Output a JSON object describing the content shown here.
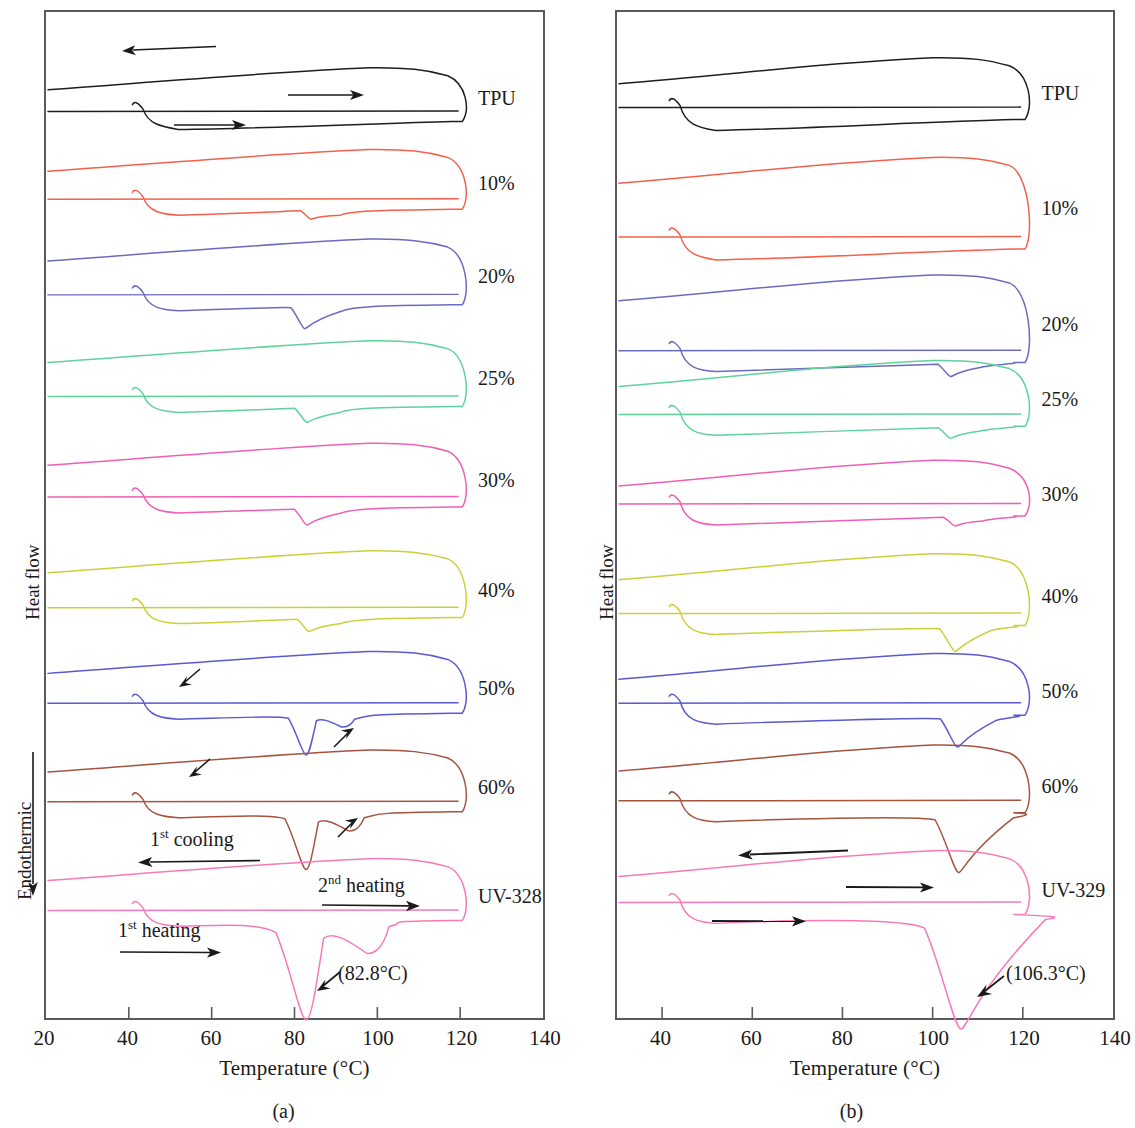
{
  "figure": {
    "type": "dsc-thermogram-pair",
    "panels": [
      {
        "id": "a",
        "caption": "(a)",
        "xlabel": "Temperature (°C)",
        "ylabel": "Heat flow",
        "direction_label": "Endothermic",
        "direction_arrow": "down",
        "xlim": [
          20,
          140
        ],
        "xticks": [
          20,
          40,
          60,
          80,
          100,
          120,
          140
        ],
        "xticklabels": [
          "20",
          "40",
          "60",
          "80",
          "100",
          "120",
          "140"
        ],
        "curves": [
          {
            "label": "TPU",
            "color": "#1e1e1e"
          },
          {
            "label": "10%",
            "color": "#f4614b"
          },
          {
            "label": "20%",
            "color": "#6a6ac0"
          },
          {
            "label": "25%",
            "color": "#5fd39a"
          },
          {
            "label": "30%",
            "color": "#ef5fb5"
          },
          {
            "label": "40%",
            "color": "#cdcf3a"
          },
          {
            "label": "50%",
            "color": "#5a5ad0"
          },
          {
            "label": "60%",
            "color": "#a6533f"
          },
          {
            "label": "UV-328",
            "color": "#f77ab8"
          }
        ],
        "annotations": [
          {
            "text": "1st cooling",
            "sup": "st",
            "base": "1",
            "tail": " cooling",
            "arrow": "left"
          },
          {
            "text": "2nd heating",
            "sup": "nd",
            "base": "2",
            "tail": " heating",
            "arrow": "right"
          },
          {
            "text": "1st heating",
            "sup": "st",
            "base": "1",
            "tail": " heating",
            "arrow": "right"
          },
          {
            "text": "(82.8°C)",
            "arrow": "down-left"
          }
        ],
        "peak_label": "(82.8°C)",
        "peak_temperature": 82.8
      },
      {
        "id": "b",
        "caption": "(b)",
        "xlabel": "Temperature (°C)",
        "ylabel": "Heat flow",
        "xlim": [
          30,
          140
        ],
        "xticks": [
          40,
          60,
          80,
          100,
          120,
          140
        ],
        "xticklabels": [
          "40",
          "60",
          "80",
          "100",
          "120",
          "140"
        ],
        "curves": [
          {
            "label": "TPU",
            "color": "#1e1e1e"
          },
          {
            "label": "10%",
            "color": "#f4614b"
          },
          {
            "label": "20%",
            "color": "#6a6ac0"
          },
          {
            "label": "25%",
            "color": "#5fd39a"
          },
          {
            "label": "30%",
            "color": "#ef5fb5"
          },
          {
            "label": "40%",
            "color": "#cdcf3a"
          },
          {
            "label": "50%",
            "color": "#5a5ad0"
          },
          {
            "label": "60%",
            "color": "#a6533f"
          },
          {
            "label": "UV-329",
            "color": "#f77ab8"
          }
        ],
        "peak_label": "(106.3°C)",
        "peak_temperature": 106.3
      }
    ]
  },
  "chart_data": {
    "type": "line",
    "title": "",
    "xlabel": "Temperature (°C)",
    "ylabel": "Heat flow (Endothermic down)",
    "grid": false,
    "legend": "right-inline-labels",
    "panels": [
      {
        "panel": "a",
        "caption": "(a)",
        "xlim": [
          20,
          140
        ],
        "xticks": [
          20,
          40,
          60,
          80,
          100,
          120,
          140
        ],
        "sample_set": "TPU / UV-328 blends",
        "melting_peak_uv328_C": 82.8,
        "series": [
          {
            "name": "TPU",
            "color": "#1e1e1e",
            "cooling_baseline_y": 78,
            "heating_baseline_y": 100,
            "melt_peak_C": null,
            "melt_depth": 0
          },
          {
            "name": "10%",
            "color": "#f4614b",
            "cooling_baseline_y": 160,
            "heating_baseline_y": 188,
            "melt_peak_C": 84.0,
            "melt_depth": 10
          },
          {
            "name": "20%",
            "color": "#6a6ac0",
            "cooling_baseline_y": 250,
            "heating_baseline_y": 284,
            "melt_peak_C": 82.5,
            "melt_depth": 24
          },
          {
            "name": "25%",
            "color": "#5fd39a",
            "cooling_baseline_y": 352,
            "heating_baseline_y": 386,
            "melt_peak_C": 83.0,
            "melt_depth": 16
          },
          {
            "name": "30%",
            "color": "#ef5fb5",
            "cooling_baseline_y": 455,
            "heating_baseline_y": 487,
            "melt_peak_C": 83.0,
            "melt_depth": 18
          },
          {
            "name": "40%",
            "color": "#cdcf3a",
            "cooling_baseline_y": 563,
            "heating_baseline_y": 598,
            "melt_peak_C": 83.5,
            "melt_depth": 14
          },
          {
            "name": "50%",
            "color": "#5a5ad0",
            "cooling_baseline_y": 664,
            "heating_baseline_y": 694,
            "melt_peak_C": 82.8,
            "melt_depth": 42
          },
          {
            "name": "60%",
            "color": "#a6533f",
            "cooling_baseline_y": 763,
            "heating_baseline_y": 793,
            "melt_peak_C": 82.8,
            "melt_depth": 58
          },
          {
            "name": "UV-328",
            "color": "#f77ab8",
            "cooling_baseline_y": 872,
            "heating_baseline_y": 902,
            "melt_peak_C": 82.8,
            "melt_depth": 100
          }
        ]
      },
      {
        "panel": "b",
        "caption": "(b)",
        "xlim": [
          30,
          140
        ],
        "xticks": [
          40,
          60,
          80,
          100,
          120,
          140
        ],
        "sample_set": "TPU / UV-329 blends",
        "melting_peak_uv329_C": 106.3,
        "series": [
          {
            "name": "TPU",
            "color": "#1e1e1e",
            "cooling_baseline_y": 72,
            "heating_baseline_y": 96,
            "melt_peak_C": null,
            "melt_depth": 0
          },
          {
            "name": "10%",
            "color": "#f4614b",
            "cooling_baseline_y": 172,
            "heating_baseline_y": 226,
            "melt_peak_C": null,
            "melt_depth": 0
          },
          {
            "name": "20%",
            "color": "#6a6ac0",
            "cooling_baseline_y": 290,
            "heating_baseline_y": 340,
            "melt_peak_C": 104.0,
            "melt_depth": 14
          },
          {
            "name": "25%",
            "color": "#5fd39a",
            "cooling_baseline_y": 376,
            "heating_baseline_y": 404,
            "melt_peak_C": 104.0,
            "melt_depth": 12
          },
          {
            "name": "30%",
            "color": "#ef5fb5",
            "cooling_baseline_y": 476,
            "heating_baseline_y": 494,
            "melt_peak_C": 105.0,
            "melt_depth": 10
          },
          {
            "name": "40%",
            "color": "#cdcf3a",
            "cooling_baseline_y": 570,
            "heating_baseline_y": 604,
            "melt_peak_C": 105.0,
            "melt_depth": 26
          },
          {
            "name": "50%",
            "color": "#5a5ad0",
            "cooling_baseline_y": 670,
            "heating_baseline_y": 694,
            "melt_peak_C": 105.5,
            "melt_depth": 32
          },
          {
            "name": "60%",
            "color": "#a6533f",
            "cooling_baseline_y": 762,
            "heating_baseline_y": 792,
            "melt_peak_C": 105.8,
            "melt_depth": 60
          },
          {
            "name": "UV-329",
            "color": "#f77ab8",
            "cooling_baseline_y": 868,
            "heating_baseline_y": 894,
            "melt_peak_C": 106.3,
            "melt_depth": 115
          }
        ]
      }
    ]
  }
}
